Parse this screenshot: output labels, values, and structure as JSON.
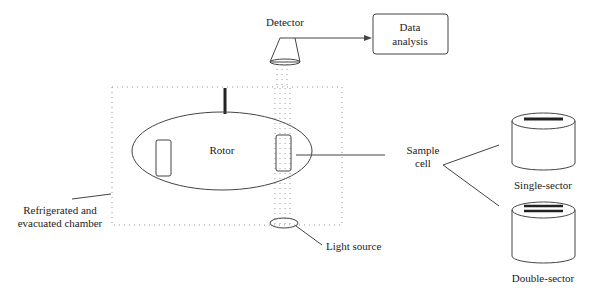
{
  "diagram": {
    "type": "analytical ultracentrifuge schematic",
    "labels": {
      "detector": "Detector",
      "data_analysis_line1": "Data",
      "data_analysis_line2": "analysis",
      "rotor": "Rotor",
      "sample_cell_line1": "Sample",
      "sample_cell_line2": "cell",
      "chamber_line1": "Refrigerated and",
      "chamber_line2": "evacuated chamber",
      "light_source": "Light source",
      "single_sector": "Single-sector",
      "double_sector": "Double-sector"
    },
    "colors": {
      "line": "#444444",
      "dotted": "#999999",
      "text": "#222222",
      "background": "#ffffff"
    }
  }
}
